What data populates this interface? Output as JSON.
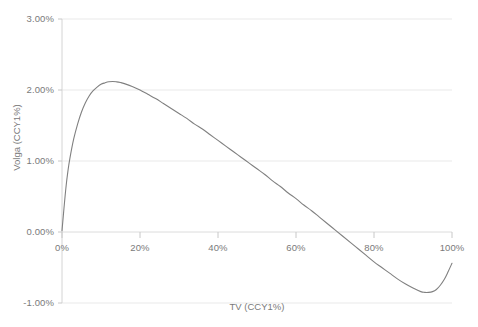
{
  "chart_data": {
    "type": "line",
    "title": "",
    "xlabel": "TV (CCY1%)",
    "ylabel": "Volga (CCY1%)",
    "xlim": [
      0,
      100
    ],
    "ylim": [
      -1.0,
      3.0
    ],
    "grid": true,
    "legend": "none",
    "x_tick_labels": [
      "0%",
      "20%",
      "40%",
      "60%",
      "80%",
      "100%"
    ],
    "x_tick_values": [
      0,
      20,
      40,
      60,
      80,
      100
    ],
    "y_tick_labels": [
      "-1.00%",
      "0.00%",
      "1.00%",
      "2.00%",
      "3.00%"
    ],
    "y_tick_values": [
      -1.0,
      0.0,
      1.0,
      2.0,
      3.0
    ],
    "series": [
      {
        "name": "Volga",
        "color": "#808080",
        "x": [
          0,
          0.5,
          1,
          1.5,
          2,
          3,
          4,
          5,
          6,
          7,
          8,
          9,
          10,
          11,
          12,
          13,
          14,
          15,
          16,
          18,
          20,
          22,
          24,
          26,
          28,
          30,
          32,
          34,
          36,
          38,
          40,
          42,
          44,
          46,
          48,
          50,
          52,
          54,
          56,
          58,
          60,
          62,
          64,
          66,
          68,
          70,
          72,
          74,
          76,
          78,
          80,
          82,
          84,
          86,
          88,
          90,
          92,
          93,
          94,
          95,
          96,
          97,
          98,
          99,
          100
        ],
        "y": [
          0.02,
          0.33,
          0.62,
          0.85,
          1.03,
          1.31,
          1.52,
          1.69,
          1.82,
          1.92,
          1.99,
          2.04,
          2.08,
          2.1,
          2.115,
          2.12,
          2.115,
          2.105,
          2.09,
          2.05,
          2.0,
          1.94,
          1.88,
          1.81,
          1.74,
          1.67,
          1.6,
          1.52,
          1.45,
          1.37,
          1.29,
          1.21,
          1.13,
          1.05,
          0.97,
          0.89,
          0.81,
          0.72,
          0.64,
          0.55,
          0.47,
          0.38,
          0.3,
          0.21,
          0.12,
          0.03,
          -0.06,
          -0.15,
          -0.24,
          -0.33,
          -0.42,
          -0.5,
          -0.58,
          -0.66,
          -0.73,
          -0.79,
          -0.84,
          -0.85,
          -0.85,
          -0.84,
          -0.81,
          -0.75,
          -0.67,
          -0.56,
          -0.44
        ]
      }
    ],
    "annotations": {
      "peak_x": 13,
      "peak_y": 2.12,
      "zero_crossing_x": 70.5,
      "min_x": 93,
      "min_y": -0.85,
      "end_y": -0.44
    },
    "colors": {
      "line": "#808080",
      "gridline": "#e8e8e8",
      "axis": "#d0d0d0",
      "text": "#7a7a7a",
      "background": "#ffffff"
    }
  }
}
